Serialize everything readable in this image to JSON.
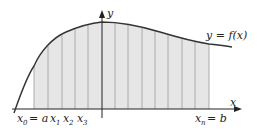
{
  "diagram": {
    "axes": {
      "x_label": "x",
      "y_label": "y"
    },
    "curve_label": "y = f(x)",
    "labels": {
      "x0": "x",
      "x0_sub": "0",
      "x0_eq": "= a",
      "x1": "x",
      "x1_sub": "1",
      "x2": "x",
      "x2_sub": "2",
      "x3": "x",
      "x3_sub": "3",
      "xn": "x",
      "xn_sub": "n",
      "xn_eq": "= b"
    },
    "strip_count": 13,
    "colors": {
      "fill": "#e6e6e6",
      "stroke": "#333333",
      "grid": "#999999"
    }
  }
}
